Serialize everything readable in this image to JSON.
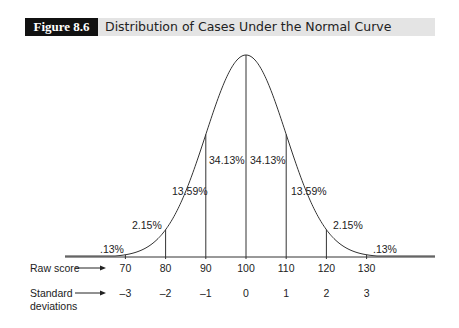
{
  "header": {
    "figure_label": "Figure 8.6",
    "title": "Distribution of Cases Under the Normal Curve"
  },
  "rows": {
    "raw_score_label": "Raw score",
    "sd_label_line1": "Standard",
    "sd_label_line2": "deviations"
  },
  "chart_data": {
    "type": "area",
    "title": "Distribution of Cases Under the Normal Curve",
    "xlabel": "Raw score / Standard deviations",
    "ylabel": "",
    "raw_scores": [
      70,
      80,
      90,
      100,
      110,
      120,
      130
    ],
    "standard_deviations": [
      "-3",
      "-2",
      "-1",
      "0",
      "1",
      "2",
      "3"
    ],
    "segments": [
      {
        "range": "< -3 SD",
        "percent": ".13%"
      },
      {
        "range": "-3 to -2 SD",
        "percent": "2.15%"
      },
      {
        "range": "-2 to -1 SD",
        "percent": "13.59%"
      },
      {
        "range": "-1 to 0 SD",
        "percent": "34.13%"
      },
      {
        "range": "0 to 1 SD",
        "percent": "34.13%"
      },
      {
        "range": "1 to 2 SD",
        "percent": "13.59%"
      },
      {
        "range": "2 to 3 SD",
        "percent": "2.15%"
      },
      {
        "range": "> 3 SD",
        "percent": ".13%"
      }
    ],
    "mean": 100,
    "sd": 10,
    "grid": false,
    "legend": "none"
  }
}
